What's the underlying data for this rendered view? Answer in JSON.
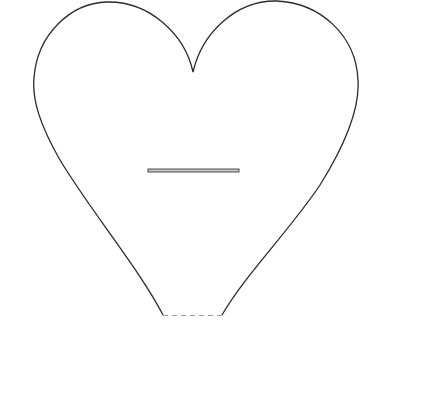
{
  "diagram": {
    "colors": {
      "background": "#ffffff",
      "outline": "#2b2b2b",
      "slot_fill": "#c8c8c8",
      "slot_stroke": "#3a3a3a",
      "dashed_base": "#9a9a9a"
    },
    "outline": {
      "cusp": [
        193,
        72
      ],
      "left_lobe_top": [
        107,
        2
      ],
      "left_extreme": [
        34,
        80
      ],
      "right_lobe_top": [
        275,
        1
      ],
      "right_extreme": [
        358,
        80
      ],
      "bottom_left": [
        163,
        315
      ],
      "bottom_right": [
        222,
        315
      ]
    },
    "slot": {
      "x": 148,
      "y": 169,
      "width": 91,
      "height": 3
    },
    "base_line": {
      "style": "dashed",
      "x1": 163,
      "x2": 222,
      "y": 315
    }
  }
}
